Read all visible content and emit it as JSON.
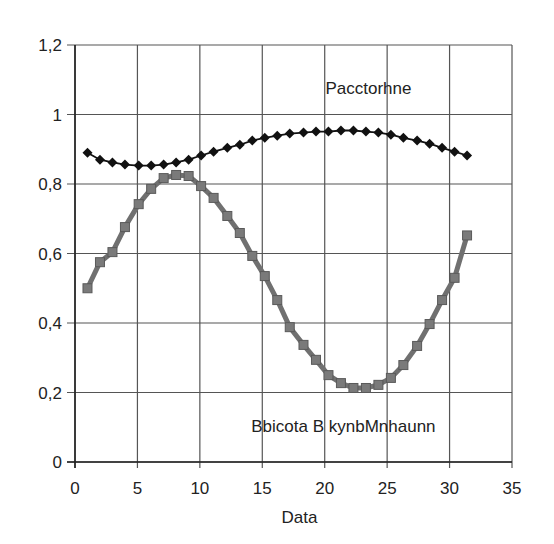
{
  "chart_data": {
    "type": "line",
    "title": "",
    "xlabel": "Data",
    "ylabel": "",
    "xlim": [
      0,
      35
    ],
    "ylim": [
      0,
      1.2
    ],
    "x_ticks": [
      "0",
      "5",
      "10",
      "15",
      "20",
      "25",
      "30",
      "35"
    ],
    "y_ticks": [
      "0",
      "0,2",
      "0,4",
      "0,6",
      "0,8",
      "1",
      "1,2"
    ],
    "grid": true,
    "legend": "none (inline annotations)",
    "annotations": [
      {
        "text": "Pacctorhne",
        "x": 23.5,
        "y": 1.075
      },
      {
        "text": "Bbicota B kynbMnhaunn",
        "x": 21.5,
        "y": 0.105
      }
    ],
    "x": [
      1.0,
      2.0,
      3.0,
      4.0,
      5.1,
      6.1,
      7.1,
      8.1,
      9.1,
      10.1,
      11.1,
      12.2,
      13.2,
      14.2,
      15.2,
      16.2,
      17.2,
      18.3,
      19.3,
      20.3,
      21.3,
      22.3,
      23.3,
      24.3,
      25.3,
      26.3,
      27.4,
      28.4,
      29.4,
      30.4,
      31.4
    ],
    "series": [
      {
        "name": "Pacctorhne",
        "marker": "diamond",
        "color": "#111111",
        "values": [
          0.89,
          0.87,
          0.862,
          0.856,
          0.853,
          0.853,
          0.856,
          0.862,
          0.87,
          0.882,
          0.893,
          0.904,
          0.913,
          0.925,
          0.933,
          0.939,
          0.945,
          0.948,
          0.951,
          0.951,
          0.954,
          0.954,
          0.951,
          0.948,
          0.942,
          0.933,
          0.925,
          0.916,
          0.904,
          0.893,
          0.882
        ]
      },
      {
        "name": "Bbicota B kynbMnhaunn",
        "marker": "square",
        "color": "#707070",
        "values": [
          0.5,
          0.575,
          0.604,
          0.676,
          0.742,
          0.786,
          0.817,
          0.826,
          0.823,
          0.794,
          0.76,
          0.708,
          0.659,
          0.593,
          0.535,
          0.466,
          0.388,
          0.337,
          0.294,
          0.25,
          0.227,
          0.213,
          0.213,
          0.222,
          0.242,
          0.279,
          0.334,
          0.397,
          0.466,
          0.53,
          0.652
        ]
      }
    ]
  },
  "colors": {
    "background": "#ffffff",
    "grid": "#555555",
    "axis": "#222222",
    "series_upper": "#111111",
    "series_lower": "#707070",
    "series_lower_marker": "#7a7a7a"
  }
}
